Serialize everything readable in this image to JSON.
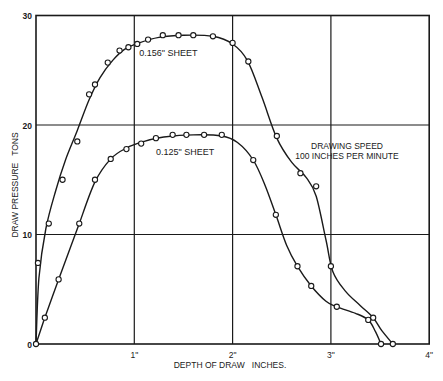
{
  "chart_data": {
    "type": "line",
    "title": "",
    "xlabel": "DEPTH OF DRAW   INCHES.",
    "ylabel": "DRAW PRESSURE   TONS",
    "xlim": [
      0,
      4
    ],
    "ylim": [
      0,
      30
    ],
    "x_ticks": [
      {
        "value": 1,
        "label": "1\""
      },
      {
        "value": 2,
        "label": "2\""
      },
      {
        "value": 3,
        "label": "3\""
      },
      {
        "value": 4,
        "label": "4\""
      }
    ],
    "y_ticks": [
      {
        "value": 0,
        "label": "0"
      },
      {
        "value": 10,
        "label": "10"
      },
      {
        "value": 20,
        "label": "20"
      },
      {
        "value": 30,
        "label": "30"
      }
    ],
    "grid": true,
    "legend": "inline labels",
    "annotation": {
      "line1": "DRAWING SPEED",
      "line2": "100 INCHES PER MINUTE"
    },
    "series": [
      {
        "name": "0.156\" SHEET",
        "label_pos": {
          "x": 1.05,
          "y": 26.3
        },
        "curve": [
          [
            0,
            0
          ],
          [
            0.03,
            6
          ],
          [
            0.1,
            10.5
          ],
          [
            0.2,
            14
          ],
          [
            0.3,
            16.8
          ],
          [
            0.42,
            19.5
          ],
          [
            0.54,
            22.3
          ],
          [
            0.65,
            24.3
          ],
          [
            0.78,
            25.9
          ],
          [
            0.9,
            26.9
          ],
          [
            1.05,
            27.5
          ],
          [
            1.25,
            28.0
          ],
          [
            1.5,
            28.2
          ],
          [
            1.8,
            28.1
          ],
          [
            2.0,
            27.4
          ],
          [
            2.15,
            25.9
          ],
          [
            2.3,
            22.5
          ],
          [
            2.45,
            18.8
          ],
          [
            2.6,
            16.6
          ],
          [
            2.75,
            15.2
          ],
          [
            2.85,
            13.5
          ],
          [
            2.95,
            9.5
          ],
          [
            3.02,
            6.6
          ],
          [
            3.15,
            4.8
          ],
          [
            3.3,
            3.5
          ],
          [
            3.43,
            2.4
          ],
          [
            3.52,
            1.2
          ],
          [
            3.63,
            0
          ]
        ],
        "points": [
          [
            0.02,
            7.4
          ],
          [
            0.13,
            11.0
          ],
          [
            0.27,
            15.0
          ],
          [
            0.42,
            18.5
          ],
          [
            0.54,
            22.8
          ],
          [
            0.6,
            23.7
          ],
          [
            0.73,
            25.7
          ],
          [
            0.85,
            26.8
          ],
          [
            0.94,
            27.1
          ],
          [
            1.03,
            27.4
          ],
          [
            1.14,
            27.8
          ],
          [
            1.29,
            28.2
          ],
          [
            1.45,
            28.2
          ],
          [
            1.6,
            28.2
          ],
          [
            1.8,
            28.1
          ],
          [
            2.0,
            27.5
          ],
          [
            2.16,
            25.8
          ],
          [
            2.45,
            19.0
          ],
          [
            2.69,
            15.6
          ],
          [
            2.85,
            14.4
          ],
          [
            3.0,
            7.1
          ],
          [
            3.43,
            2.4
          ],
          [
            3.63,
            0
          ]
        ]
      },
      {
        "name": "0.125\" SHEET",
        "label_pos": {
          "x": 1.22,
          "y": 17.3
        },
        "curve": [
          [
            0,
            0
          ],
          [
            0.09,
            2.4
          ],
          [
            0.23,
            5.9
          ],
          [
            0.35,
            8.8
          ],
          [
            0.44,
            11.0
          ],
          [
            0.6,
            14.8
          ],
          [
            0.76,
            16.9
          ],
          [
            0.92,
            17.9
          ],
          [
            1.1,
            18.5
          ],
          [
            1.3,
            18.9
          ],
          [
            1.6,
            19.1
          ],
          [
            1.89,
            19.0
          ],
          [
            2.05,
            18.4
          ],
          [
            2.21,
            16.8
          ],
          [
            2.33,
            14.5
          ],
          [
            2.44,
            11.8
          ],
          [
            2.55,
            9.0
          ],
          [
            2.66,
            7.1
          ],
          [
            2.8,
            5.3
          ],
          [
            2.95,
            3.9
          ],
          [
            3.06,
            3.4
          ],
          [
            3.25,
            2.8
          ],
          [
            3.38,
            2.2
          ],
          [
            3.45,
            1.2
          ],
          [
            3.51,
            0
          ]
        ],
        "points": [
          [
            0,
            0
          ],
          [
            0.09,
            2.4
          ],
          [
            0.23,
            5.9
          ],
          [
            0.44,
            11.0
          ],
          [
            0.6,
            15.0
          ],
          [
            0.76,
            16.9
          ],
          [
            0.92,
            17.8
          ],
          [
            1.07,
            18.3
          ],
          [
            1.22,
            18.8
          ],
          [
            1.39,
            19.1
          ],
          [
            1.53,
            19.1
          ],
          [
            1.71,
            19.1
          ],
          [
            1.89,
            19.1
          ],
          [
            2.21,
            16.8
          ],
          [
            2.44,
            11.8
          ],
          [
            2.66,
            7.1
          ],
          [
            2.8,
            5.3
          ],
          [
            3.06,
            3.4
          ],
          [
            3.38,
            2.2
          ],
          [
            3.51,
            0
          ]
        ]
      }
    ]
  },
  "colors": {
    "ink": "#1a1a1a",
    "background": "#ffffff"
  }
}
